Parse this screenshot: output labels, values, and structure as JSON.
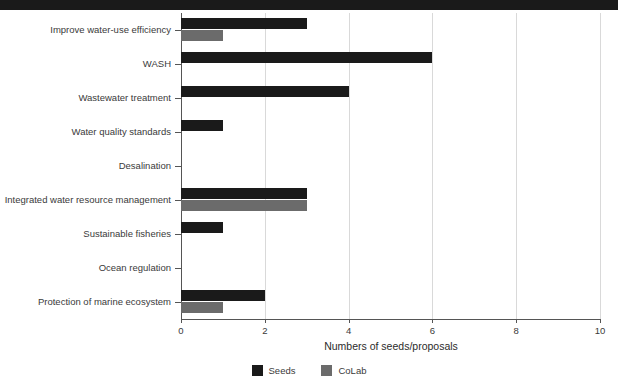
{
  "chart_data": {
    "type": "bar",
    "orientation": "horizontal",
    "title": "",
    "xlabel": "Numbers of seeds/proposals",
    "ylabel": "",
    "xlim": [
      0,
      10
    ],
    "xticks": [
      "0",
      "2",
      "4",
      "6",
      "8",
      "10"
    ],
    "grid": "vertical",
    "legend_position": "bottom-center",
    "categories": [
      "Improve water-use efficiency",
      "WASH",
      "Wastewater treatment",
      "Water quality standards",
      "Desalination",
      "Integrated water resource management",
      "Sustainable fisheries",
      "Ocean regulation",
      "Protection of marine ecosystem"
    ],
    "series": [
      {
        "name": "Seeds",
        "color": "#1a1a1a",
        "values": [
          3,
          6,
          4,
          1,
          0,
          3,
          1,
          0,
          2
        ]
      },
      {
        "name": "CoLab",
        "color": "#6b6b6b",
        "values": [
          1,
          0,
          0,
          0,
          0,
          3,
          0,
          0,
          1
        ]
      }
    ]
  },
  "legend": {
    "items": [
      {
        "label": "Seeds",
        "color": "#1a1a1a"
      },
      {
        "label": "CoLab",
        "color": "#6b6b6b"
      }
    ]
  },
  "colors": {
    "seeds": "#1a1a1a",
    "colab": "#6b6b6b",
    "gridline": "#d9d9d9",
    "axis": "#555555",
    "text": "#3a3a3a",
    "background": "#ffffff"
  },
  "clipped_top_bar": {
    "color": "#1a1a1a",
    "note": ""
  }
}
